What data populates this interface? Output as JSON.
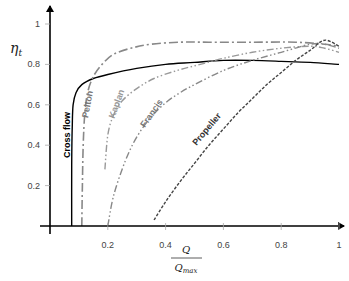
{
  "chart_data": {
    "type": "line",
    "title": "",
    "xlabel_numerator": "Q",
    "xlabel_denominator": "Q_max",
    "xlabel": "Q / Q_max",
    "ylabel": "η_t",
    "xlim": [
      0,
      1
    ],
    "ylim": [
      0,
      1
    ],
    "grid": false,
    "legend": "inline curve labels",
    "x_ticks": [
      0.2,
      0.4,
      0.6,
      0.8,
      1
    ],
    "x_tick_labels": [
      "0.2",
      "0.4",
      "0.6",
      "0.8",
      "1"
    ],
    "y_ticks": [
      0.2,
      0.4,
      0.6,
      0.8,
      1
    ],
    "y_tick_labels": [
      "0.2",
      "0.4",
      "0.6",
      "0.8",
      "1"
    ],
    "series": [
      {
        "name": "Cross flow",
        "style": "solid",
        "color": "#000000",
        "x": [
          0.075,
          0.075,
          0.077,
          0.08,
          0.09,
          0.11,
          0.15,
          0.2,
          0.3,
          0.4,
          0.5,
          0.6,
          0.7,
          0.8,
          0.9,
          1.0
        ],
        "y": [
          0.0,
          0.3,
          0.5,
          0.6,
          0.66,
          0.7,
          0.73,
          0.75,
          0.78,
          0.8,
          0.81,
          0.82,
          0.82,
          0.815,
          0.81,
          0.8
        ]
      },
      {
        "name": "Pelton",
        "style": "dash-dot",
        "color": "#888888",
        "x": [
          0.11,
          0.112,
          0.115,
          0.12,
          0.13,
          0.15,
          0.18,
          0.22,
          0.28,
          0.35,
          0.45,
          0.55,
          0.7,
          0.85,
          0.95,
          1.0
        ],
        "y": [
          0.0,
          0.2,
          0.4,
          0.55,
          0.66,
          0.74,
          0.8,
          0.85,
          0.88,
          0.9,
          0.91,
          0.91,
          0.91,
          0.91,
          0.9,
          0.89
        ]
      },
      {
        "name": "Kaplan",
        "style": "dash-dot-dot",
        "color": "#999999",
        "x": [
          0.19,
          0.2,
          0.22,
          0.25,
          0.3,
          0.36,
          0.44,
          0.52,
          0.6,
          0.7,
          0.8,
          0.9,
          0.95,
          1.0
        ],
        "y": [
          0.28,
          0.45,
          0.55,
          0.62,
          0.68,
          0.73,
          0.77,
          0.8,
          0.83,
          0.86,
          0.88,
          0.89,
          0.88,
          0.86
        ]
      },
      {
        "name": "Francis",
        "style": "dash-dot-dot",
        "color": "#888888",
        "x": [
          0.2,
          0.22,
          0.26,
          0.3,
          0.35,
          0.4,
          0.45,
          0.5,
          0.6,
          0.7,
          0.8,
          0.9,
          0.95,
          1.0
        ],
        "y": [
          0.0,
          0.15,
          0.32,
          0.44,
          0.54,
          0.61,
          0.66,
          0.7,
          0.77,
          0.82,
          0.86,
          0.9,
          0.9,
          0.88
        ]
      },
      {
        "name": "Propeller",
        "style": "dashed",
        "color": "#444444",
        "x": [
          0.36,
          0.4,
          0.45,
          0.5,
          0.55,
          0.6,
          0.65,
          0.7,
          0.75,
          0.8,
          0.85,
          0.9,
          0.95,
          1.0
        ],
        "y": [
          0.03,
          0.12,
          0.22,
          0.31,
          0.4,
          0.48,
          0.56,
          0.63,
          0.7,
          0.76,
          0.82,
          0.87,
          0.92,
          0.89
        ]
      }
    ],
    "annotations": [
      {
        "text": "Cross flow",
        "x": 0.07,
        "y": 0.45,
        "rotation": -90
      },
      {
        "text": "Pelton",
        "x": 0.14,
        "y": 0.6,
        "rotation": -80
      },
      {
        "text": "Kaplan",
        "x": 0.24,
        "y": 0.6,
        "rotation": -70
      },
      {
        "text": "Francis",
        "x": 0.36,
        "y": 0.55,
        "rotation": -55
      },
      {
        "text": "Propeller",
        "x": 0.55,
        "y": 0.47,
        "rotation": -50
      }
    ]
  },
  "plot_area": {
    "origin_px": [
      50,
      226
    ],
    "x_scale_px_per_unit": 289,
    "y_scale_px_per_unit": 202
  }
}
